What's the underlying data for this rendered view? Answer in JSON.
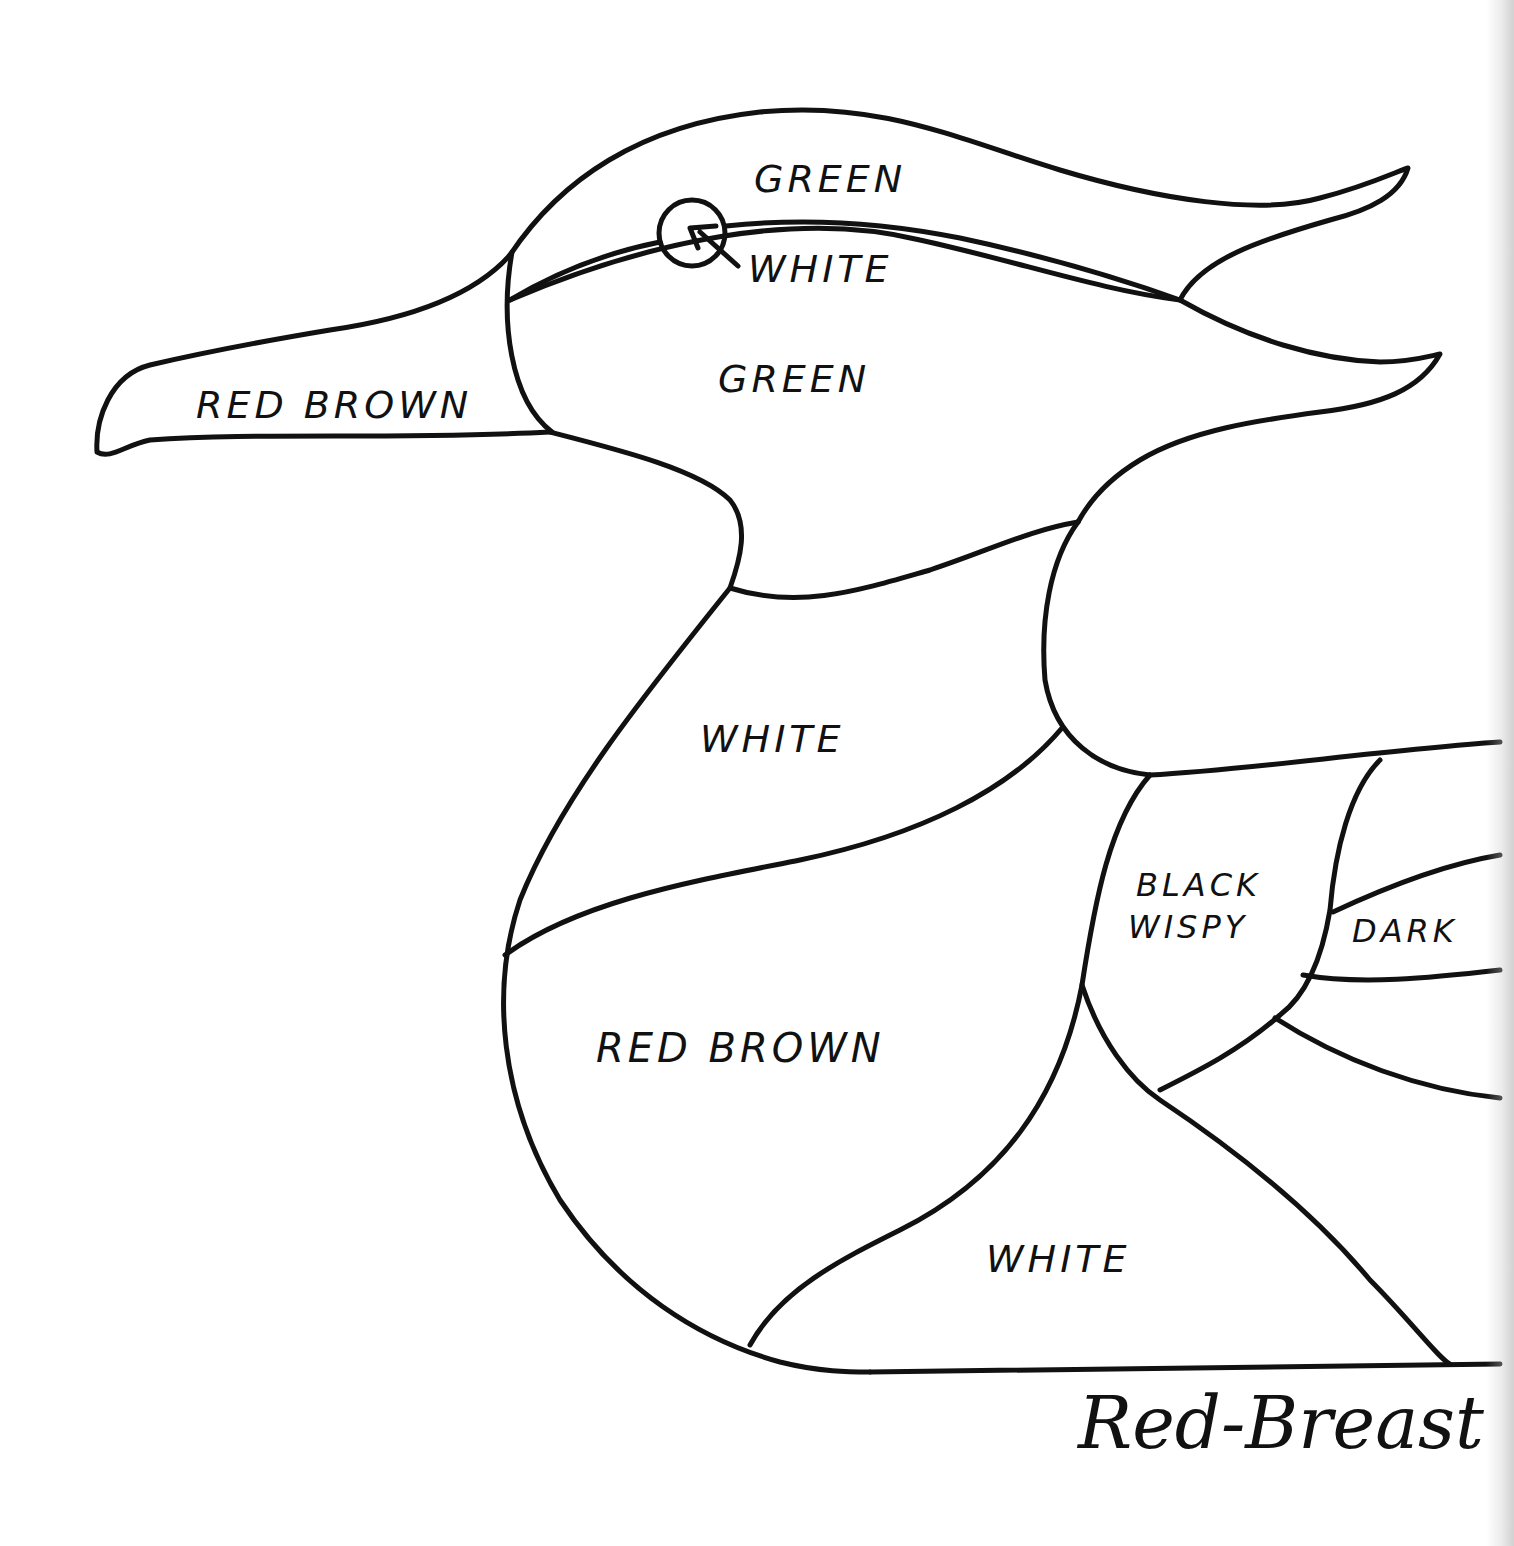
{
  "pattern": {
    "title": "Red-Breast",
    "subject": "bird-pattern-outline",
    "line_color": "#111111",
    "background": "#ffffff",
    "regions": [
      {
        "id": "crown",
        "label": "GREEN"
      },
      {
        "id": "eye-stripe",
        "label": "WHITE"
      },
      {
        "id": "cheek",
        "label": "GREEN"
      },
      {
        "id": "bill",
        "label": "RED BROWN"
      },
      {
        "id": "neck",
        "label": "WHITE"
      },
      {
        "id": "breast",
        "label": "RED BROWN"
      },
      {
        "id": "belly",
        "label": "WHITE"
      },
      {
        "id": "side",
        "label": "BLACK WISPY"
      },
      {
        "id": "wing-stripe",
        "label": "DARK"
      }
    ],
    "labels": {
      "crown": "GREEN",
      "eye_stripe": "WHITE",
      "cheek": "GREEN",
      "bill": "RED BROWN",
      "neck": "WHITE",
      "breast": "RED BROWN",
      "belly": "WHITE",
      "side_line1": "BLACK",
      "side_line2": "WISPY",
      "wing_stripe": "DARK"
    },
    "eye_marker": "circle-with-arrow"
  }
}
